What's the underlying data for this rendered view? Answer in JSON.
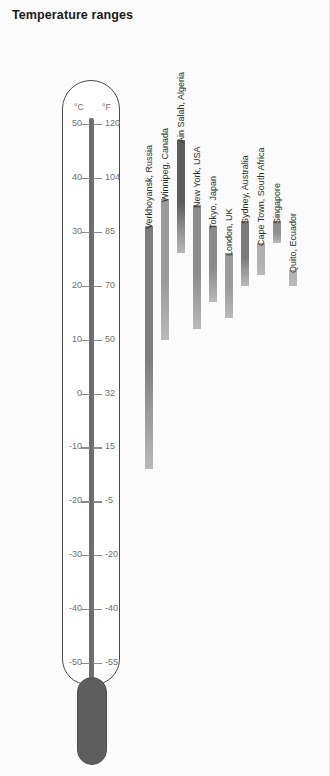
{
  "title": "Temperature ranges",
  "thermometer": {
    "celsius_unit": "°C",
    "fahrenheit_unit": "°F",
    "celsius_ticks": [
      "50",
      "40",
      "30",
      "20",
      "10",
      "0",
      "-10",
      "-20",
      "-30",
      "-40",
      "-50"
    ],
    "fahrenheit_ticks": [
      "120",
      "104",
      "85",
      "70",
      "50",
      "32",
      "15",
      "-5",
      "-20",
      "-40",
      "-55"
    ],
    "scale_max_c": 50,
    "scale_min_c": -50,
    "bulb_color": "#5e5e5e",
    "tube_color": "#6e6e6e",
    "outline_color": "#4a4a4a"
  },
  "chart_data": {
    "type": "bar",
    "title": "Temperature ranges",
    "xlabel": "",
    "ylabel": "Temperature (°C)",
    "ylim": [
      -50,
      50
    ],
    "grid": false,
    "legend": "none",
    "units": "°C",
    "categories": [
      "Verkhoyansk, Russia",
      "Winnipeg, Canada",
      "Ain Salah, Algeria",
      "New York, USA",
      "Tokyo, Japan",
      "London, UK",
      "Sydney, Australia",
      "Cape Town, South Africa",
      "Singapore",
      "Quito, Ecuador"
    ],
    "series": [
      {
        "name": "High (°C)",
        "values": [
          31,
          36,
          47,
          35,
          31,
          26,
          32,
          28,
          32,
          23
        ]
      },
      {
        "name": "Low (°C)",
        "values": [
          -14,
          10,
          26,
          12,
          17,
          14,
          20,
          22,
          28,
          20
        ]
      }
    ],
    "bars": [
      {
        "city": "Verkhoyansk, Russia",
        "high": 31,
        "low": -14,
        "color": "#7d7d7d"
      },
      {
        "city": "Winnipeg, Canada",
        "high": 36,
        "low": 10,
        "color": "#9a9a9a"
      },
      {
        "city": "Ain Salah, Algeria",
        "high": 47,
        "low": 26,
        "color": "#5d5d5d"
      },
      {
        "city": "New York, USA",
        "high": 35,
        "low": 12,
        "color": "#8c8c8c"
      },
      {
        "city": "Tokyo, Japan",
        "high": 31,
        "low": 17,
        "color": "#8a8a8a"
      },
      {
        "city": "London, UK",
        "high": 26,
        "low": 14,
        "color": "#9d9d9d"
      },
      {
        "city": "Sydney, Australia",
        "high": 32,
        "low": 20,
        "color": "#7a7a7a"
      },
      {
        "city": "Cape Town, South Africa",
        "high": 28,
        "low": 22,
        "color": "#b0b0b0"
      },
      {
        "city": "Singapore",
        "high": 32,
        "low": 28,
        "color": "#8f8f8f"
      },
      {
        "city": "Quito, Ecuador",
        "high": 23,
        "low": 20,
        "color": "#b4b4b4"
      }
    ]
  }
}
